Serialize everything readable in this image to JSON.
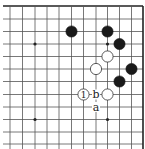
{
  "diagram": {
    "type": "go-board-fragment",
    "corner": "top-right",
    "grid": {
      "columns_x": [
        10,
        22.5,
        35,
        47,
        59,
        71.5,
        83.5,
        96,
        107.5,
        119.5,
        131.5,
        143
      ],
      "rows_y": [
        6,
        19,
        31.5,
        44,
        56.5,
        69,
        81.5,
        94.5,
        107,
        119.5,
        132,
        144
      ],
      "left_extend_x": 3,
      "bottom_extend_y": 149,
      "top_edge": true,
      "right_edge": true
    },
    "star_points": [
      {
        "col": 2,
        "row": 3
      },
      {
        "col": 8,
        "row": 3
      },
      {
        "col": 2,
        "row": 9
      },
      {
        "col": 8,
        "row": 9
      }
    ],
    "stones": [
      {
        "color": "black",
        "col": 5,
        "row": 2,
        "label": ""
      },
      {
        "color": "black",
        "col": 8,
        "row": 2,
        "label": ""
      },
      {
        "color": "black",
        "col": 9,
        "row": 3,
        "label": ""
      },
      {
        "color": "black",
        "col": 10,
        "row": 5,
        "label": ""
      },
      {
        "color": "black",
        "col": 9,
        "row": 6,
        "label": ""
      },
      {
        "color": "white",
        "col": 8,
        "row": 4,
        "label": ""
      },
      {
        "color": "white",
        "col": 7,
        "row": 5,
        "label": ""
      },
      {
        "color": "white",
        "col": 8,
        "row": 7,
        "label": ""
      },
      {
        "color": "white",
        "col": 6,
        "row": 7,
        "label": "1"
      }
    ],
    "point_labels": [
      {
        "text": "b",
        "col": 7,
        "row": 7
      },
      {
        "text": "a",
        "col": 7,
        "row": 8
      }
    ],
    "stone_radius": 5.6,
    "colors": {
      "black_stone": "#1a1a1a",
      "white_stone": "#ffffff",
      "line": "#555555"
    }
  }
}
